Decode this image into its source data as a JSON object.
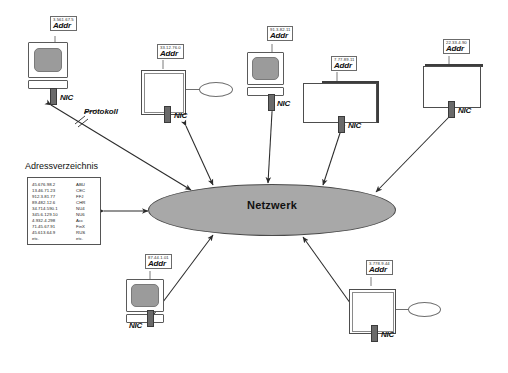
{
  "diagram": {
    "title_center": "Netzwerk",
    "protocol_label": "Protokoll",
    "addr_word": "Addr",
    "nic_label": "NIC",
    "directory": {
      "title": "Adressverzeichnis",
      "rows": [
        {
          "address": "45.676.98.2",
          "name": "ABU"
        },
        {
          "address": "13.46.71.23",
          "name": "CEC"
        },
        {
          "address": "912.3.81.77",
          "name": "FFJ"
        },
        {
          "address": "89.482.12.6",
          "name": "CHR"
        },
        {
          "address": "34.714.590.1",
          "name": "NU4"
        },
        {
          "address": "345.6.129.10",
          "name": "NU6"
        },
        {
          "address": "4.932.4.298",
          "name": "Acc"
        },
        {
          "address": "71.45.67.91",
          "name": "FinX"
        },
        {
          "address": "45.613.64.9",
          "name": "RUS"
        },
        {
          "address": "etc.",
          "name": "etc."
        }
      ]
    },
    "nodes": [
      {
        "id": "node-1",
        "kind": "workstation",
        "address": "3.561.67.5",
        "addr_word": "Addr",
        "nic_label": "NIC",
        "has_disk": false
      },
      {
        "id": "node-2",
        "kind": "server",
        "address": "33.12.76.0",
        "addr_word": "Addr",
        "nic_label": "NIC",
        "has_disk": true
      },
      {
        "id": "node-3",
        "kind": "workstation",
        "address": "91.3.82.11",
        "addr_word": "Addr",
        "nic_label": "NIC",
        "has_disk": false
      },
      {
        "id": "node-4",
        "kind": "server",
        "address": "7.77.89.11",
        "addr_word": "Addr",
        "nic_label": "NIC",
        "has_disk": false
      },
      {
        "id": "node-5",
        "kind": "server",
        "address": "22.33.4.90",
        "addr_word": "Addr",
        "nic_label": "NIC",
        "has_disk": false
      },
      {
        "id": "node-6",
        "kind": "workstation",
        "address": "87.44.1.01",
        "addr_word": "Addr",
        "nic_label": "NIC",
        "has_disk": false
      },
      {
        "id": "node-7",
        "kind": "server",
        "address": "3.778.9.44",
        "addr_word": "Addr",
        "nic_label": "NIC",
        "has_disk": true
      }
    ],
    "colors": {
      "network_fill": "#a8a8a8",
      "line": "#333333",
      "screen_fill": "#9b9b9b",
      "nic_fill": "#6a6a6a",
      "background": "#ffffff"
    }
  }
}
